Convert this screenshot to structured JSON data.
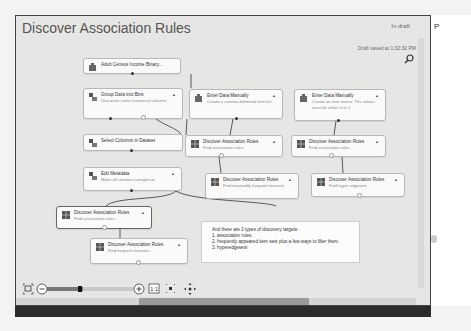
{
  "header": {
    "title": "Discover Association Rules",
    "status": "In draft",
    "saved": "Draft saved at 1:32:32 PM",
    "right_panel_initial": "P"
  },
  "nodes": [
    {
      "id": "adult",
      "title": "Adult Census Income Binary...",
      "desc": "",
      "icon": "dataset-icon",
      "chevron": false
    },
    {
      "id": "group",
      "title": "Group Data into Bins",
      "desc": "Discretize some numerical columns",
      "icon": "module-icon",
      "chevron": true
    },
    {
      "id": "enter1",
      "title": "Enter Data Manually",
      "desc": "Create a comma-delimited item list",
      "icon": "dataset-icon",
      "chevron": true
    },
    {
      "id": "enter2",
      "title": "Enter Data Manually",
      "desc": "Create an item matrix. The values must be either 0 or 1.",
      "icon": "dataset-icon",
      "chevron": true
    },
    {
      "id": "select",
      "title": "Select Columns in Dataset",
      "desc": "",
      "icon": "module-icon",
      "chevron": false
    },
    {
      "id": "dar1",
      "title": "Discover Association Rules",
      "desc": "Find association rules",
      "icon": "grid-icon",
      "chevron": true
    },
    {
      "id": "dar2",
      "title": "Discover Association Rules",
      "desc": "Find association rules",
      "icon": "grid-icon",
      "chevron": true
    },
    {
      "id": "edit",
      "title": "Edit Metadata",
      "desc": "Make all columns categorical",
      "icon": "module-icon",
      "chevron": true
    },
    {
      "id": "darmax",
      "title": "Discover Association Rules",
      "desc": "Find maximally frequent itemsets",
      "icon": "grid-icon",
      "chevron": true
    },
    {
      "id": "darhyper",
      "title": "Discover Association Rules",
      "desc": "Find hyper edgesets",
      "icon": "grid-icon",
      "chevron": true
    },
    {
      "id": "dar3",
      "title": "Discover Association Rules",
      "desc": "Find association rules",
      "icon": "grid-icon",
      "chevron": true
    },
    {
      "id": "darfreq",
      "title": "Discover Association Rules",
      "desc": "Find frequent itemsets",
      "icon": "grid-icon",
      "chevron": true
    }
  ],
  "note": {
    "lines": [
      "And there are 3 types of discovery targets:",
      "1. association rules.",
      "2. frequently appeared item sets plus a few ways to filter them.",
      "3. hyperedgesets"
    ]
  },
  "zoom_controls": {
    "fit_label": "fit-to-screen",
    "zoom_out": "−",
    "zoom_in": "+",
    "actual_size": "1:1"
  }
}
